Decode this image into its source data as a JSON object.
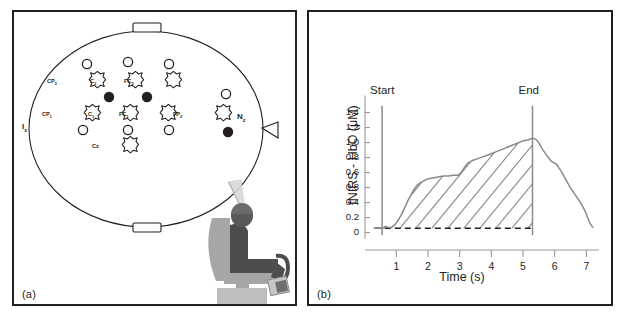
{
  "figure": {
    "panels": [
      {
        "id": "a",
        "caption": "(a)",
        "title": "EEG/fNIRS optode montage on head with seated subject"
      },
      {
        "id": "b",
        "caption": "(b)",
        "title": "fNIRS HbO response over time"
      }
    ]
  },
  "panel_a": {
    "caption": "(a)",
    "landmarks": [
      {
        "name": "inion",
        "label": "I",
        "sub": "z"
      },
      {
        "name": "nasion",
        "label": "N",
        "sub": "z"
      }
    ],
    "electrodes": [
      {
        "label": "CP",
        "sub": "3",
        "row": 1
      },
      {
        "label": "C",
        "sub": "3",
        "row": 1
      },
      {
        "label": "FC",
        "sub": "3",
        "row": 1
      },
      {
        "label": "CP",
        "sub": "1",
        "row": 2
      },
      {
        "label": "C",
        "sub": "1",
        "row": 2
      },
      {
        "label": "FC",
        "sub": "1",
        "row": 2
      },
      {
        "label": "Cz",
        "sub": "",
        "row": 3
      },
      {
        "label": "FP",
        "sub": "2",
        "row": 2
      }
    ],
    "legend_shapes": {
      "open_circle": "source-optode",
      "filled_circle": "detector-optode",
      "cross": "eeg-electrode"
    },
    "subject": "seated-subject-with-device"
  },
  "panel_b": {
    "caption": "(b)",
    "annotations": [
      {
        "name": "start-marker",
        "text": "Start",
        "x": 0.55
      },
      {
        "name": "end-marker",
        "text": "End",
        "x": 5.3
      }
    ],
    "colors": {
      "curve": "#8a8a8a",
      "marker_line": "#8a8a8a",
      "baseline": "#231f20",
      "hatch": "#8a8a8a",
      "axis": "#8a8a8a",
      "frame": "#231f20"
    }
  },
  "chart_data": {
    "type": "area",
    "title": "",
    "xlabel": "Time (s)",
    "ylabel": "fNIRS - HbO (μM)",
    "xlim": [
      0.2,
      7.4
    ],
    "ylim": [
      -0.04,
      1.5
    ],
    "xticks": [
      1,
      2,
      3,
      4,
      5,
      6,
      7
    ],
    "xticklabels": [
      "1",
      "2",
      "3",
      "4",
      "5",
      "6",
      "7"
    ],
    "yticks": [
      0,
      0.2,
      0.4,
      0.6,
      0.8,
      1.0,
      1.2,
      1.4,
      1.6
    ],
    "yticklabels": [
      "0",
      "0.2",
      "0.4",
      "0.8",
      "0.6",
      "0.8",
      "1.0",
      "1.2",
      "1.4"
    ],
    "grid": false,
    "legend": "none",
    "baseline_value": 0.05,
    "hatched_region": {
      "from": 0.55,
      "to": 5.3,
      "label": "integrated-response-area"
    },
    "series": [
      {
        "name": "fNIRS - HbO",
        "x": [
          0.3,
          0.45,
          0.55,
          0.65,
          0.75,
          0.85,
          0.95,
          1.05,
          1.15,
          1.25,
          1.35,
          1.45,
          1.55,
          1.65,
          1.75,
          1.85,
          1.95,
          2.05,
          2.2,
          2.35,
          2.5,
          2.65,
          2.8,
          2.95,
          3.05,
          3.15,
          3.25,
          3.4,
          3.55,
          3.7,
          3.85,
          4.0,
          4.2,
          4.4,
          4.6,
          4.8,
          5.0,
          5.15,
          5.3,
          5.4,
          5.5,
          5.6,
          5.75,
          5.9,
          6.05,
          6.2,
          6.35,
          6.5,
          6.65,
          6.8,
          6.95,
          7.1,
          7.2
        ],
        "y": [
          0.05,
          0.05,
          0.05,
          0.07,
          0.06,
          0.06,
          0.09,
          0.14,
          0.2,
          0.28,
          0.36,
          0.43,
          0.5,
          0.55,
          0.58,
          0.6,
          0.62,
          0.63,
          0.64,
          0.65,
          0.66,
          0.66,
          0.67,
          0.67,
          0.7,
          0.76,
          0.81,
          0.84,
          0.86,
          0.88,
          0.9,
          0.92,
          0.95,
          0.98,
          1.01,
          1.04,
          1.07,
          1.08,
          1.1,
          1.09,
          1.05,
          0.98,
          0.9,
          0.83,
          0.8,
          0.72,
          0.62,
          0.52,
          0.44,
          0.36,
          0.26,
          0.12,
          0.06
        ]
      }
    ]
  }
}
